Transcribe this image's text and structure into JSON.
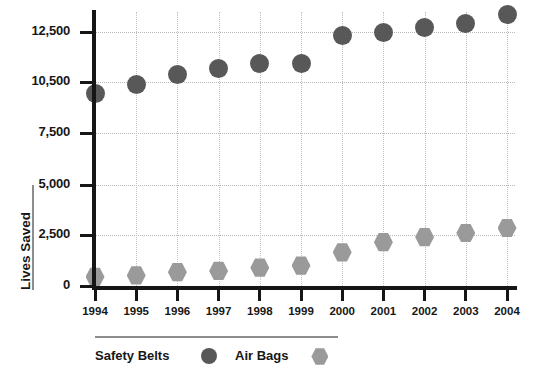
{
  "chart_data": {
    "type": "scatter",
    "title": "",
    "xlabel": "",
    "ylabel": "Lives Saved",
    "grid": true,
    "legend_position": "bottom",
    "categories": [
      "1994",
      "1995",
      "1996",
      "1997",
      "1998",
      "1999",
      "2000",
      "2001",
      "2002",
      "2003",
      "2004"
    ],
    "y_tick_labels": [
      "0",
      "2,500",
      "5,000",
      "7,500",
      "10,500",
      "12,500"
    ],
    "y_tick_values": [
      0,
      2500,
      5000,
      7500,
      10500,
      12500
    ],
    "ylim": [
      0,
      13600
    ],
    "series": [
      {
        "name": "Safety Belts",
        "marker": "circle",
        "color": "#585858",
        "values": [
          9800,
          10350,
          10800,
          11050,
          11250,
          11250,
          12350,
          12500,
          12700,
          12850,
          13200
        ]
      },
      {
        "name": "Air Bags",
        "marker": "hexagon",
        "color": "#9a9a9a",
        "values": [
          450,
          520,
          680,
          740,
          900,
          1000,
          1650,
          2150,
          2400,
          2600,
          2850
        ]
      }
    ]
  },
  "axis": {
    "y_title": "Lives Saved"
  },
  "legend": {
    "entries": [
      {
        "label": "Safety Belts",
        "marker": "circle",
        "color": "#585858"
      },
      {
        "label": "Air Bags",
        "marker": "hexagon",
        "color": "#9a9a9a"
      }
    ]
  },
  "colors": {
    "safety_belts": "#585858",
    "air_bags": "#9a9a9a",
    "axis": "#161616",
    "grid": "#b9b9b9"
  }
}
